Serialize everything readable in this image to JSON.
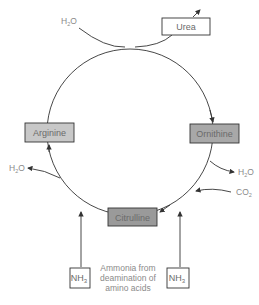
{
  "diagram": {
    "nodes": {
      "urea": {
        "label": "Urea",
        "fill": "#ffffff"
      },
      "arginine": {
        "label": "Arginine",
        "fill": "#c8c8c8"
      },
      "ornithine": {
        "label": "Ornithine",
        "fill": "#a8a8a8"
      },
      "citrulline": {
        "label": "Citrulline",
        "fill": "#9a9a9a"
      },
      "nh3_left": {
        "label": "NH",
        "sub": "3"
      },
      "nh3_right": {
        "label": "NH",
        "sub": "3"
      }
    },
    "side_labels": {
      "water_top": {
        "label": "H",
        "sub": "2",
        "suffix": "O"
      },
      "water_left": {
        "label": "H",
        "sub": "2",
        "suffix": "O"
      },
      "water_right": {
        "label": "H",
        "sub": "2",
        "suffix": "O"
      },
      "co2": {
        "label": "CO",
        "sub": "2"
      }
    },
    "caption": {
      "line1": "Ammonia from",
      "line2": "deamination of",
      "line3": "amino acids"
    },
    "colors": {
      "line": "#333333",
      "box_border": "#333333",
      "text": "#8a8a8a"
    }
  }
}
